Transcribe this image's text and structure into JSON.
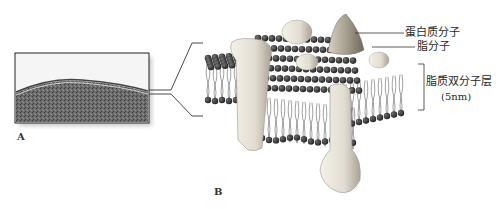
{
  "figure": {
    "panel_a_label": "A",
    "panel_b_label": "B",
    "panel_a_description": "electron micrograph of cell membrane",
    "panel_b_description": "fluid mosaic model of cell membrane"
  },
  "annotations": {
    "protein": "蛋白质分子",
    "lipid": "脂分子",
    "bilayer": "脂质双分子层",
    "bilayer_thickness": "(5nm)"
  },
  "colors": {
    "lipid_head": "#2b2b2b",
    "protein": "#e8e4dc",
    "protein_shadow": "#b8b2a6",
    "micrograph_dark": "#5a5a5a",
    "line": "#333333"
  }
}
